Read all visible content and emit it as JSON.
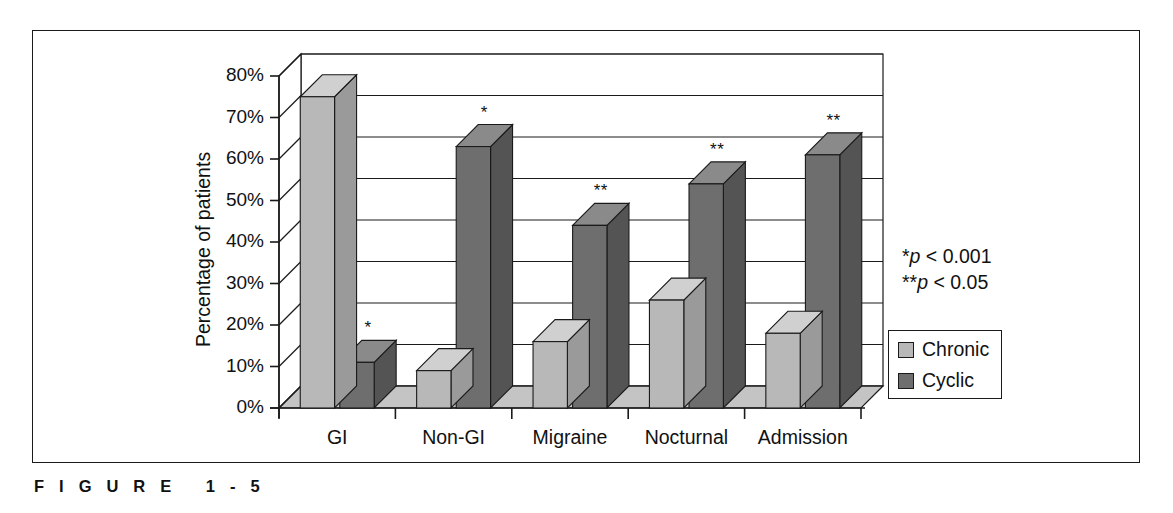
{
  "figure": {
    "caption": "F I G U R E   1 - 5"
  },
  "chart_data": {
    "type": "bar",
    "title": "",
    "subtitle": "",
    "xlabel": "",
    "ylabel": "Percentage of patients",
    "ylim": [
      0,
      80
    ],
    "ytick_values": [
      0,
      10,
      20,
      30,
      40,
      50,
      60,
      70,
      80
    ],
    "ytick_labels": [
      "0%",
      "10%",
      "20%",
      "30%",
      "40%",
      "50%",
      "60%",
      "70%",
      "80%"
    ],
    "grid": true,
    "grid_axis": "y",
    "legend_position": "right",
    "style": "3d-column",
    "categories": [
      "GI",
      "Non-GI",
      "Migraine",
      "Nocturnal",
      "Admission"
    ],
    "series": [
      {
        "name": "Chronic",
        "color": "#b8b8b8",
        "values": [
          75,
          9,
          16,
          26,
          18
        ]
      },
      {
        "name": "Cyclic",
        "color": "#6e6e6e",
        "values": [
          11,
          63,
          44,
          54,
          61
        ]
      }
    ],
    "annotations": [
      {
        "category": "GI",
        "series": "Cyclic",
        "text": "*"
      },
      {
        "category": "Non-GI",
        "series": "Cyclic",
        "text": "*"
      },
      {
        "category": "Migraine",
        "series": "Cyclic",
        "text": "**"
      },
      {
        "category": "Nocturnal",
        "series": "Cyclic",
        "text": "**"
      },
      {
        "category": "Admission",
        "series": "Cyclic",
        "text": "**"
      }
    ],
    "notes": [
      {
        "marker": "*",
        "text": "p",
        "rest": " < 0.001"
      },
      {
        "marker": "**",
        "text": "p",
        "rest": " < 0.05"
      }
    ]
  },
  "colors": {
    "chronic": "#b8b8b8",
    "cyclic": "#6e6e6e",
    "chronic_top": "#d0d0d0",
    "chronic_side": "#9a9a9a",
    "cyclic_top": "#8a8a8a",
    "cyclic_side": "#545454",
    "axis": "#1a1a1a",
    "grid": "#1a1a1a",
    "background": "#ffffff",
    "wall": "#ffffff",
    "floor": "#c4c4c4"
  }
}
